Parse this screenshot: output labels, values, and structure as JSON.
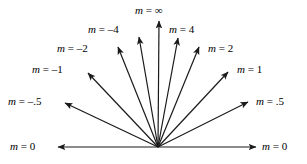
{
  "figure": {
    "colors": {
      "stroke": "#1a1a1a",
      "text": "#000000",
      "background": "#ffffff"
    },
    "vertex": {
      "x": 158,
      "y": 147
    }
  },
  "chart_data": {
    "type": "scatter",
    "title": "",
    "xlabel": "",
    "ylabel": "",
    "grid": false,
    "legend": "none",
    "categories": [
      "m = 0",
      "m = .5",
      "m = 1",
      "m = 2",
      "m = 4",
      "m = ∞",
      "m = -4",
      "m = -2",
      "m = -1",
      "m = -.5",
      "m = 0"
    ],
    "values": [
      0,
      0.5,
      1,
      2,
      4,
      null,
      -4,
      -2,
      -1,
      -0.5,
      0
    ],
    "rays": [
      {
        "id": "ray-m-0-left",
        "slope_text": "0",
        "slope_value": 0,
        "label": {
          "var": "m",
          "eq": "=",
          "val": "0"
        },
        "tip": {
          "x": 58,
          "y": 147
        },
        "label_pos": {
          "x": 10,
          "y": 141
        }
      },
      {
        "id": "ray-m-neg-half",
        "slope_text": "-.5",
        "slope_value": -0.5,
        "label": {
          "var": "m",
          "eq": "=",
          "val": "–.5"
        },
        "tip": {
          "x": 65,
          "y": 103
        },
        "label_pos": {
          "x": 8,
          "y": 96
        }
      },
      {
        "id": "ray-m-neg-1",
        "slope_text": "-1",
        "slope_value": -1,
        "label": {
          "var": "m",
          "eq": "=",
          "val": "–1"
        },
        "tip": {
          "x": 88,
          "y": 73
        },
        "label_pos": {
          "x": 32,
          "y": 64
        }
      },
      {
        "id": "ray-m-neg-2",
        "slope_text": "-2",
        "slope_value": -2,
        "label": {
          "var": "m",
          "eq": "=",
          "val": "–2"
        },
        "tip": {
          "x": 118,
          "y": 47
        },
        "label_pos": {
          "x": 57,
          "y": 43
        }
      },
      {
        "id": "ray-m-neg-4",
        "slope_text": "-4",
        "slope_value": -4,
        "label": {
          "var": "m",
          "eq": "=",
          "val": "–4"
        },
        "tip": {
          "x": 139,
          "y": 37
        },
        "label_pos": {
          "x": 88,
          "y": 24
        }
      },
      {
        "id": "ray-m-infinity",
        "slope_text": "∞",
        "slope_value": null,
        "label": {
          "var": "m",
          "eq": "=",
          "val": "∞"
        },
        "tip": {
          "x": 159,
          "y": 21
        },
        "label_pos": {
          "x": 135,
          "y": 5
        }
      },
      {
        "id": "ray-m-4",
        "slope_text": "4",
        "slope_value": 4,
        "label": {
          "var": "m",
          "eq": "=",
          "val": "4"
        },
        "tip": {
          "x": 178,
          "y": 38
        },
        "label_pos": {
          "x": 169,
          "y": 24
        }
      },
      {
        "id": "ray-m-2",
        "slope_text": "2",
        "slope_value": 2,
        "label": {
          "var": "m",
          "eq": "=",
          "val": "2"
        },
        "tip": {
          "x": 199,
          "y": 47
        },
        "label_pos": {
          "x": 208,
          "y": 43
        }
      },
      {
        "id": "ray-m-1",
        "slope_text": "1",
        "slope_value": 1,
        "label": {
          "var": "m",
          "eq": "=",
          "val": "1"
        },
        "tip": {
          "x": 228,
          "y": 72
        },
        "label_pos": {
          "x": 237,
          "y": 64
        }
      },
      {
        "id": "ray-m-half",
        "slope_text": ".5",
        "slope_value": 0.5,
        "label": {
          "var": "m",
          "eq": "=",
          "val": ".5"
        },
        "tip": {
          "x": 248,
          "y": 102
        },
        "label_pos": {
          "x": 256,
          "y": 96
        }
      },
      {
        "id": "ray-m-0-right",
        "slope_text": "0",
        "slope_value": 0,
        "label": {
          "var": "m",
          "eq": "=",
          "val": "0"
        },
        "tip": {
          "x": 256,
          "y": 147
        },
        "label_pos": {
          "x": 262,
          "y": 141
        }
      }
    ]
  }
}
